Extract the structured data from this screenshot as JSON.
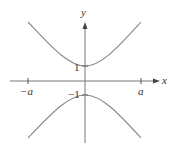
{
  "diagram": {
    "type": "hyperbola-graph",
    "equation_shape": "y^2 - x^2/a^2 = 1 (two branches opening up and down)",
    "axes": {
      "x_label": "x",
      "y_label": "y"
    },
    "x_ticks": [
      {
        "label": "−a",
        "value": -1
      },
      {
        "label": "a",
        "value": 1
      }
    ],
    "y_marks": [
      {
        "label": "1",
        "value": 1
      },
      {
        "label": "−1",
        "value": -1
      }
    ],
    "colors": {
      "axis": "#555555",
      "curve": "#888888",
      "text": "#333333"
    }
  }
}
